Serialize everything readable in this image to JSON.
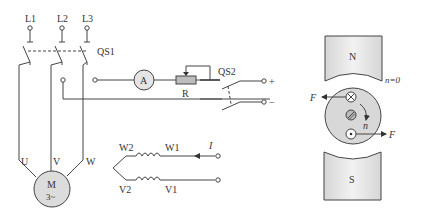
{
  "circuit": {
    "supply_labels": [
      "L1",
      "L2",
      "L3"
    ],
    "main_switch": "QS1",
    "motor": {
      "label": "M",
      "phase": "3~",
      "terminals": [
        "U",
        "V",
        "W"
      ]
    },
    "ammeter": "A",
    "rheostat": "R",
    "dc_switch": "QS2",
    "dc_terminals": {
      "positive": "+",
      "negative": "−"
    },
    "windings": {
      "top_left": "W2",
      "top_right": "W1",
      "bottom_left": "V2",
      "bottom_right": "V1"
    },
    "current_label": "I"
  },
  "rotor_figure": {
    "north_pole": "N",
    "south_pole": "S",
    "speed_label": "n",
    "speed_value": "n=0",
    "force_left": "F",
    "force_right": "F",
    "rotation_label": "n",
    "colors": {
      "pole_fill": "#e6e6e6",
      "rotor_fill": "#d8d8d8",
      "motor_fill": "#dcdcdc"
    }
  }
}
